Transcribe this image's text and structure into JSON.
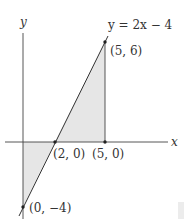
{
  "diagram": {
    "axes": {
      "x_label": "x",
      "y_label": "y"
    },
    "line": {
      "equation": "y = 2x − 4"
    },
    "points": [
      {
        "id": "p_5_6",
        "label": "(5, 6)",
        "x": 5,
        "y": 6
      },
      {
        "id": "p_2_0",
        "label": "(2, 0)",
        "x": 2,
        "y": 0
      },
      {
        "id": "p_5_0",
        "label": "(5, 0)",
        "x": 5,
        "y": 0
      },
      {
        "id": "p_0_m4",
        "label": "(0, −4)",
        "x": 0,
        "y": -4
      }
    ],
    "regions": [
      {
        "id": "upper-triangle",
        "vertices": "(2,0),(5,6),(5,0)"
      },
      {
        "id": "lower-triangle",
        "vertices": "(0,0),(2,0),(0,-4)"
      }
    ],
    "colors": {
      "shade": "#e6e6e6",
      "line": "#333333",
      "axis": "#444444"
    }
  }
}
